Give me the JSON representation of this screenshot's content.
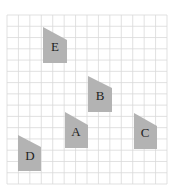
{
  "diagram": {
    "type": "grid-with-shapes",
    "grid": {
      "x0": 7,
      "y0": 15,
      "x1": 167,
      "y1": 184,
      "columns": 14,
      "rows": 15,
      "line_color": "#d9d9d9",
      "background": "#ffffff"
    },
    "shape_color": "#b3b3b3",
    "label_color": "#222222",
    "shapes": [
      {
        "id": "E",
        "label": "E",
        "points": [
          [
            43,
            27
          ],
          [
            67,
            40
          ],
          [
            67,
            63
          ],
          [
            43,
            63
          ]
        ],
        "label_x": 55,
        "label_y": 51
      },
      {
        "id": "B",
        "label": "B",
        "points": [
          [
            88,
            76
          ],
          [
            112,
            88
          ],
          [
            112,
            112
          ],
          [
            88,
            112
          ]
        ],
        "label_x": 100,
        "label_y": 100
      },
      {
        "id": "A",
        "label": "A",
        "points": [
          [
            65,
            112
          ],
          [
            88,
            125
          ],
          [
            88,
            148
          ],
          [
            65,
            148
          ]
        ],
        "label_x": 76,
        "label_y": 136
      },
      {
        "id": "C",
        "label": "C",
        "points": [
          [
            134,
            113
          ],
          [
            157,
            126
          ],
          [
            157,
            149
          ],
          [
            134,
            149
          ]
        ],
        "label_x": 145,
        "label_y": 137
      },
      {
        "id": "D",
        "label": "D",
        "points": [
          [
            18,
            135
          ],
          [
            41,
            147
          ],
          [
            41,
            171
          ],
          [
            18,
            171
          ]
        ],
        "label_x": 30,
        "label_y": 160
      }
    ]
  }
}
